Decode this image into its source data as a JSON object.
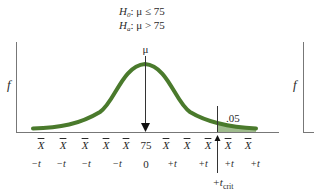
{
  "hypotheses": {
    "null": {
      "symbol": "H",
      "sub": "0",
      "relation": ": μ ≤ 75"
    },
    "alternative": {
      "symbol": "H",
      "sub": "a",
      "relation": ": μ > 75"
    }
  },
  "axis": {
    "y_label": "f",
    "second_panel_y_label": "f"
  },
  "distribution": {
    "mean_label": "μ",
    "mean_value": "75",
    "curve_color": "#4a7a2c",
    "shaded_color": "#8fb07a",
    "alpha_label": ".05",
    "critical_label": "+t",
    "critical_sub": "crit"
  },
  "x_labels": [
    "X",
    "X",
    "X",
    "X",
    "X",
    "75",
    "X",
    "X",
    "X",
    "X",
    "X"
  ],
  "t_labels": [
    "−t",
    "−t",
    "−t",
    "−t",
    "0",
    "+t",
    "+t",
    "+t",
    "+t"
  ]
}
